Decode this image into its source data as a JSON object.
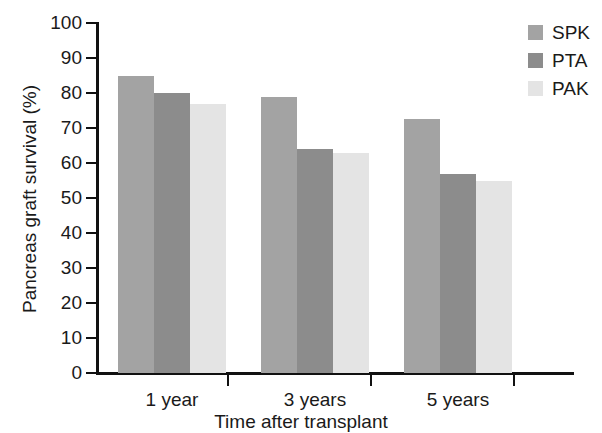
{
  "chart_data": {
    "type": "bar",
    "title": "",
    "xlabel": "Time after transplant",
    "ylabel": "Pancreas graft survival (%)",
    "categories": [
      "1 year",
      "3 years",
      "5 years"
    ],
    "series": [
      {
        "name": "SPK",
        "color": "#a3a3a3",
        "values": [
          85,
          79,
          72.5
        ]
      },
      {
        "name": "PTA",
        "color": "#8c8c8c",
        "values": [
          80,
          64,
          57
        ]
      },
      {
        "name": "PAK",
        "color": "#e4e4e4",
        "values": [
          77,
          63,
          55
        ]
      }
    ],
    "ylim": [
      0,
      100
    ],
    "y_ticks": [
      0,
      10,
      20,
      30,
      40,
      50,
      60,
      70,
      80,
      90,
      100
    ],
    "y_tick_labels": [
      "0",
      "10",
      "20",
      "30",
      "40",
      "50",
      "60",
      "70",
      "80",
      "90",
      "100"
    ],
    "grid": false,
    "legend_position": "top-right",
    "legend_entries": [
      "SPK",
      "PTA",
      "PAK"
    ]
  }
}
